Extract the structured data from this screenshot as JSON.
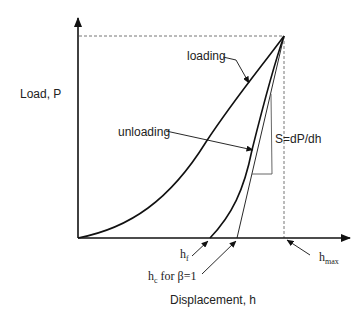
{
  "diagram": {
    "axes": {
      "y_label": "Load, P",
      "x_label": "Displacement, h"
    },
    "curves": [
      {
        "name": "loading",
        "label": "loading"
      },
      {
        "name": "unloading",
        "label": "unloading"
      }
    ],
    "annotations": {
      "stiffness": "S=dP/dh",
      "h_f": {
        "main": "h",
        "sub": "f"
      },
      "h_c": {
        "main": "h",
        "sub": "c",
        "suffix": " for β=1"
      },
      "h_max": {
        "main": "h",
        "sub": "max"
      }
    },
    "colors": {
      "line": "#111111",
      "dashed": "#666666",
      "text": "#222222"
    }
  }
}
